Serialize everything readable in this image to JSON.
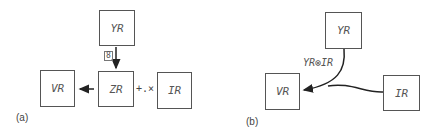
{
  "panel_a": {
    "label": "(a)",
    "nodes": {
      "yr": "YR",
      "zr": "ZR",
      "vr": "VR",
      "ir": "IR"
    },
    "edge_symbol": "8",
    "operator": "+.×"
  },
  "panel_b": {
    "label": "(b)",
    "nodes": {
      "yr": "YR",
      "vr": "VR",
      "ir": "IR"
    },
    "edge_label": "YR⊗IR"
  }
}
